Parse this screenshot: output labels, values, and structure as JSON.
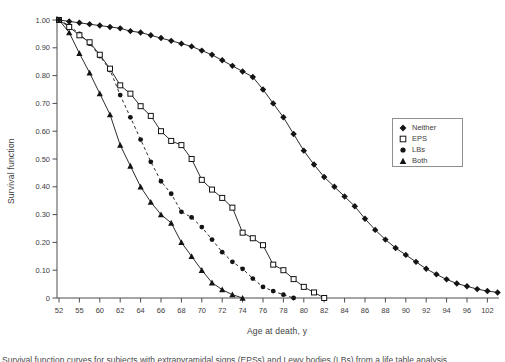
{
  "chart_data": {
    "type": "line",
    "title": "",
    "xlabel": "Age at death, y",
    "ylabel": "Survival function",
    "ylim": [
      0,
      1.0
    ],
    "grid": false,
    "legend_position": "right, boxed",
    "x_axis_note": "markers plotted at 1-slot intervals; axis ticks every 2 slots",
    "x_tick_slots": [
      0,
      2,
      4,
      6,
      8,
      10,
      12,
      14,
      16,
      18,
      20,
      22,
      24,
      26,
      28,
      30,
      32,
      34,
      36,
      38,
      40,
      42
    ],
    "x_tick_labels": [
      "52",
      "55",
      "60",
      "62",
      "64",
      "66",
      "68",
      "70",
      "72",
      "74",
      "76",
      "78",
      "80",
      "82",
      "84",
      "86",
      "88",
      "90",
      "92",
      "94",
      "96",
      "102"
    ],
    "y_tick_values": [
      0,
      0.1,
      0.2,
      0.3,
      0.4,
      0.5,
      0.6,
      0.7,
      0.8,
      0.9,
      1.0
    ],
    "y_tick_labels": [
      "0",
      "0.10",
      "0.20",
      "0.30",
      "0.40",
      "0.50",
      "0.60",
      "0.70",
      "0.80",
      "0.90",
      "1.00"
    ],
    "series": [
      {
        "name": "Neither",
        "marker": "diamond-filled",
        "line": "solid",
        "color": "#141414",
        "values": [
          1.0,
          0.995,
          0.99,
          0.985,
          0.98,
          0.975,
          0.97,
          0.96,
          0.955,
          0.945,
          0.935,
          0.925,
          0.915,
          0.905,
          0.89,
          0.875,
          0.855,
          0.835,
          0.815,
          0.795,
          0.75,
          0.7,
          0.65,
          0.59,
          0.53,
          0.48,
          0.435,
          0.4,
          0.365,
          0.33,
          0.285,
          0.245,
          0.21,
          0.18,
          0.155,
          0.13,
          0.105,
          0.085,
          0.067,
          0.052,
          0.042,
          0.032,
          0.025,
          0.02
        ]
      },
      {
        "name": "EPS",
        "marker": "square-open",
        "line": "solid",
        "color": "#141414",
        "values": [
          1.0,
          0.975,
          0.945,
          0.92,
          0.875,
          0.825,
          0.765,
          0.735,
          0.69,
          0.655,
          0.6,
          0.565,
          0.55,
          0.5,
          0.425,
          0.39,
          0.36,
          0.325,
          0.235,
          0.215,
          0.19,
          0.12,
          0.1,
          0.068,
          0.04,
          0.02,
          0.0
        ]
      },
      {
        "name": "LBs",
        "marker": "circle-filled",
        "line": "dashed",
        "color": "#141414",
        "values": [
          1.0,
          0.98,
          0.95,
          0.915,
          0.87,
          0.82,
          0.73,
          0.65,
          0.57,
          0.49,
          0.42,
          0.375,
          0.31,
          0.29,
          0.255,
          0.21,
          0.165,
          0.13,
          0.105,
          0.07,
          0.04,
          0.025,
          0.012,
          0.0
        ]
      },
      {
        "name": "Both",
        "marker": "triangle-filled",
        "line": "solid",
        "color": "#141414",
        "values": [
          1.0,
          0.955,
          0.88,
          0.81,
          0.735,
          0.66,
          0.55,
          0.475,
          0.4,
          0.345,
          0.3,
          0.27,
          0.2,
          0.15,
          0.1,
          0.055,
          0.03,
          0.012,
          0.0
        ]
      }
    ]
  },
  "caption": {
    "fragment": "Survival function curves for subjects with extrapyramidal signs (EPSs) and Lewy bodies (LBs) from a life table analysis"
  },
  "colors": {
    "ink": "#141414",
    "axis": "#4d4d4d",
    "text": "#3d3d3d",
    "legend_border": "#8f8f8f",
    "background": "#ffffff"
  }
}
